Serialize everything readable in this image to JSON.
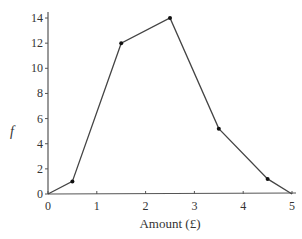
{
  "chart_data": {
    "type": "line",
    "title": "",
    "xlabel": "Amount (£)",
    "ylabel": "f",
    "x": [
      0,
      0.5,
      1.5,
      2.5,
      3.5,
      4.5,
      5
    ],
    "values": [
      0,
      1,
      12,
      14,
      5.2,
      1.2,
      0
    ],
    "series": [
      {
        "name": "frequency polygon",
        "x": [
          0,
          0.5,
          1.5,
          2.5,
          3.5,
          4.5,
          5
        ],
        "values": [
          0,
          1,
          12,
          14,
          5.2,
          1.2,
          0
        ]
      }
    ],
    "xlim": [
      0,
      5
    ],
    "ylim": [
      0,
      15
    ],
    "x_ticks": [
      "0",
      "1",
      "2",
      "3",
      "4",
      "5"
    ],
    "y_ticks": [
      "0",
      "2",
      "4",
      "6",
      "8",
      "10",
      "12",
      "14"
    ],
    "grid": false,
    "legend": null,
    "colors": {
      "line": "#444444",
      "marker": "#111111",
      "axis": "#555555"
    }
  }
}
